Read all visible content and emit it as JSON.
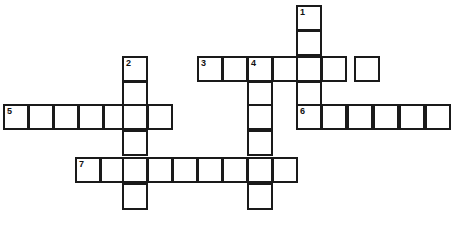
{
  "puzzle": {
    "type": "crossword-grid",
    "title": "",
    "cell_size": 25.5,
    "grid_origin": {
      "x": 3,
      "y": 4.5
    },
    "colors": {
      "background": "#ffffff",
      "cell_fill": "#ffffff",
      "border": "#1a1a1a",
      "number": "#111111"
    },
    "counts": {
      "total_entries": 7,
      "across_entries": 4,
      "down_entries": 3,
      "total_cells": 46
    },
    "entries": [
      {
        "number": "1",
        "direction": "down",
        "length": 5,
        "start_col": 11.5,
        "start_row": 0,
        "answer": ""
      },
      {
        "number": "2",
        "direction": "down",
        "length": 6,
        "start_col": 4.67,
        "start_row": 2,
        "answer": ""
      },
      {
        "number": "3",
        "direction": "across",
        "length": 7,
        "start_col": 7.62,
        "start_row": 2,
        "answer": ""
      },
      {
        "number": "4",
        "direction": "down",
        "length": 6,
        "start_col": 9.57,
        "start_row": 2,
        "answer": ""
      },
      {
        "number": "5",
        "direction": "across",
        "length": 7,
        "start_col": 0,
        "start_row": 3.9,
        "answer": ""
      },
      {
        "number": "6",
        "direction": "across",
        "length": 6,
        "start_col": 11.5,
        "start_row": 3.9,
        "answer": ""
      },
      {
        "number": "7",
        "direction": "across",
        "length": 9,
        "start_col": 2.82,
        "start_row": 6,
        "answer": ""
      }
    ],
    "cells": [
      {
        "name": "cell-r0-c11",
        "x": 296,
        "y": 5,
        "w": 26,
        "h": 26,
        "number": "1",
        "letter": ""
      },
      {
        "name": "cell-r1-c11",
        "x": 296,
        "y": 30,
        "w": 26,
        "h": 26,
        "number": "",
        "letter": ""
      },
      {
        "name": "cell-r2-c4",
        "x": 122,
        "y": 56,
        "w": 26,
        "h": 26,
        "number": "2",
        "letter": ""
      },
      {
        "name": "cell-r3-c4",
        "x": 122,
        "y": 81,
        "w": 26,
        "h": 26,
        "number": "",
        "letter": ""
      },
      {
        "name": "cell-r2-c7",
        "x": 197,
        "y": 56,
        "w": 26,
        "h": 26,
        "number": "3",
        "letter": ""
      },
      {
        "name": "cell-r2-c8",
        "x": 222,
        "y": 56,
        "w": 26,
        "h": 26,
        "number": "",
        "letter": ""
      },
      {
        "name": "cell-r2-c9",
        "x": 247,
        "y": 56,
        "w": 26,
        "h": 26,
        "number": "4",
        "letter": ""
      },
      {
        "name": "cell-r2-c10",
        "x": 272,
        "y": 56,
        "w": 26,
        "h": 26,
        "number": "",
        "letter": ""
      },
      {
        "name": "cell-r2-c11",
        "x": 296,
        "y": 56,
        "w": 26,
        "h": 26,
        "number": "",
        "letter": ""
      },
      {
        "name": "cell-r2-c12",
        "x": 321,
        "y": 56,
        "w": 26,
        "h": 26,
        "number": "",
        "letter": ""
      },
      {
        "name": "cell-r2-c13",
        "x": 354,
        "y": 56,
        "w": 26,
        "h": 26,
        "number": "",
        "letter": ""
      },
      {
        "name": "cell-r3-c9",
        "x": 247,
        "y": 81,
        "w": 26,
        "h": 26,
        "number": "",
        "letter": ""
      },
      {
        "name": "cell-r3-c11",
        "x": 296,
        "y": 81,
        "w": 26,
        "h": 26,
        "number": "",
        "letter": ""
      },
      {
        "name": "cell-r4-c0",
        "x": 3,
        "y": 104,
        "w": 26,
        "h": 26,
        "number": "5",
        "letter": ""
      },
      {
        "name": "cell-r4-c1",
        "x": 28,
        "y": 104,
        "w": 26,
        "h": 26,
        "number": "",
        "letter": ""
      },
      {
        "name": "cell-r4-c2",
        "x": 53,
        "y": 104,
        "w": 26,
        "h": 26,
        "number": "",
        "letter": ""
      },
      {
        "name": "cell-r4-c3",
        "x": 78,
        "y": 104,
        "w": 26,
        "h": 26,
        "number": "",
        "letter": ""
      },
      {
        "name": "cell-r4-c4",
        "x": 103,
        "y": 104,
        "w": 26,
        "h": 26,
        "number": "",
        "letter": ""
      },
      {
        "name": "cell-r4-c5",
        "x": 122,
        "y": 104,
        "w": 26,
        "h": 26,
        "number": "",
        "letter": ""
      },
      {
        "name": "cell-r4-c6",
        "x": 147,
        "y": 104,
        "w": 26,
        "h": 26,
        "number": "",
        "letter": ""
      },
      {
        "name": "cell-r4-c9",
        "x": 247,
        "y": 104,
        "w": 26,
        "h": 26,
        "number": "",
        "letter": ""
      },
      {
        "name": "cell-r4-c11",
        "x": 296,
        "y": 104,
        "w": 26,
        "h": 26,
        "number": "6",
        "letter": ""
      },
      {
        "name": "cell-r4-c12",
        "x": 321,
        "y": 104,
        "w": 26,
        "h": 26,
        "number": "",
        "letter": ""
      },
      {
        "name": "cell-r4-c13",
        "x": 347,
        "y": 104,
        "w": 26,
        "h": 26,
        "number": "",
        "letter": ""
      },
      {
        "name": "cell-r4-c14",
        "x": 373,
        "y": 104,
        "w": 26,
        "h": 26,
        "number": "",
        "letter": ""
      },
      {
        "name": "cell-r4-c15",
        "x": 399,
        "y": 104,
        "w": 26,
        "h": 26,
        "number": "",
        "letter": ""
      },
      {
        "name": "cell-r4-c16",
        "x": 425,
        "y": 104,
        "w": 26,
        "h": 26,
        "number": "",
        "letter": ""
      },
      {
        "name": "cell-r5-c4",
        "x": 122,
        "y": 130,
        "w": 26,
        "h": 26,
        "number": "",
        "letter": ""
      },
      {
        "name": "cell-r5-c9",
        "x": 247,
        "y": 130,
        "w": 26,
        "h": 26,
        "number": "",
        "letter": ""
      },
      {
        "name": "cell-r6-c2",
        "x": 75,
        "y": 157,
        "w": 26,
        "h": 26,
        "number": "7",
        "letter": ""
      },
      {
        "name": "cell-r6-c3",
        "x": 100,
        "y": 157,
        "w": 26,
        "h": 26,
        "number": "",
        "letter": ""
      },
      {
        "name": "cell-r6-c4",
        "x": 122,
        "y": 157,
        "w": 26,
        "h": 26,
        "number": "",
        "letter": ""
      },
      {
        "name": "cell-r6-c5",
        "x": 147,
        "y": 157,
        "w": 26,
        "h": 26,
        "number": "",
        "letter": ""
      },
      {
        "name": "cell-r6-c6",
        "x": 172,
        "y": 157,
        "w": 26,
        "h": 26,
        "number": "",
        "letter": ""
      },
      {
        "name": "cell-r6-c7",
        "x": 197,
        "y": 157,
        "w": 26,
        "h": 26,
        "number": "",
        "letter": ""
      },
      {
        "name": "cell-r6-c8",
        "x": 222,
        "y": 157,
        "w": 26,
        "h": 26,
        "number": "",
        "letter": ""
      },
      {
        "name": "cell-r6-c9",
        "x": 247,
        "y": 157,
        "w": 26,
        "h": 26,
        "number": "",
        "letter": ""
      },
      {
        "name": "cell-r6-c10",
        "x": 272,
        "y": 157,
        "w": 26,
        "h": 26,
        "number": "",
        "letter": ""
      },
      {
        "name": "cell-r7-c4",
        "x": 122,
        "y": 183,
        "w": 26,
        "h": 27,
        "number": "",
        "letter": ""
      },
      {
        "name": "cell-r7-c9",
        "x": 247,
        "y": 183,
        "w": 26,
        "h": 27,
        "number": "",
        "letter": ""
      }
    ]
  }
}
